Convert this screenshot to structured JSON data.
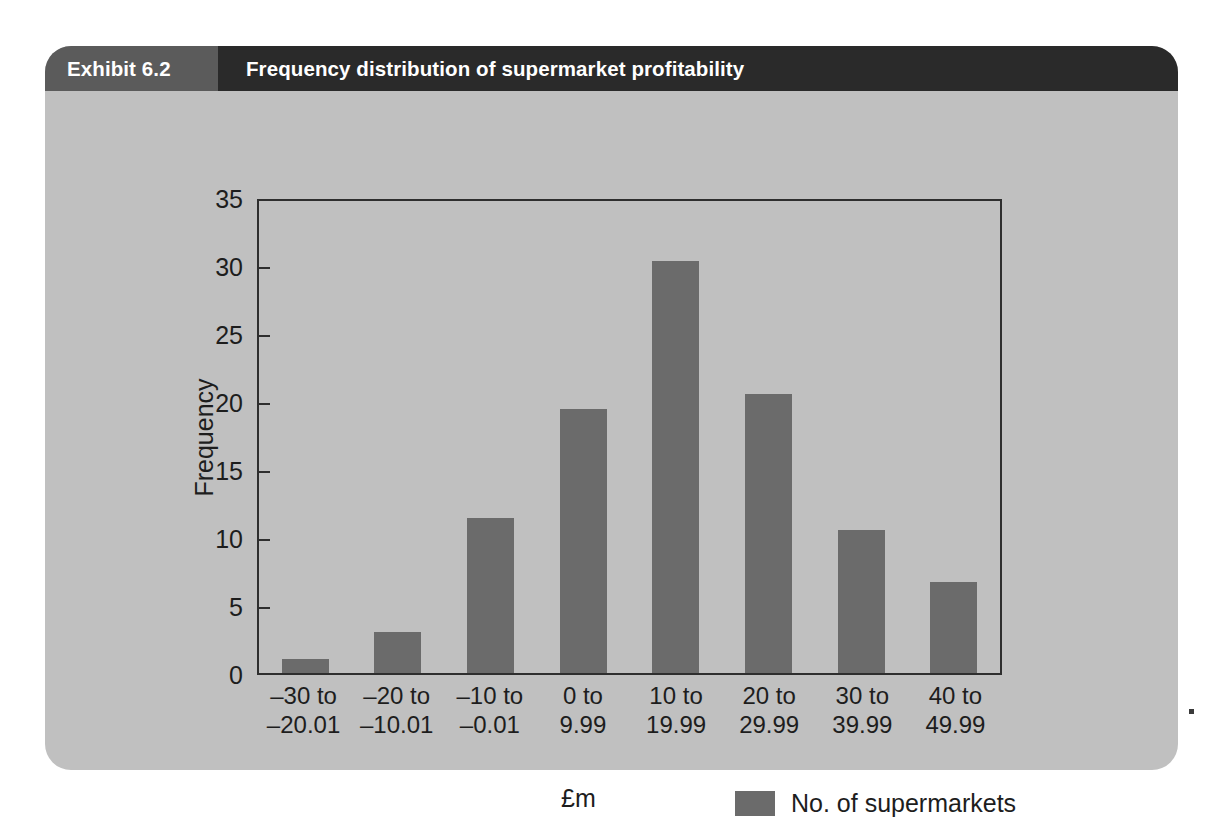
{
  "exhibit": {
    "number_label": "Exhibit 6.2",
    "title": "Frequency distribution of supermarket profitability"
  },
  "colors": {
    "card_background": "#c0c0c0",
    "header_number_band": "#5b5b5b",
    "header_title_band": "#2a2a2a",
    "bar_fill": "#6b6b6b",
    "axis_line": "#2e2e2e",
    "text": "#1d1d1d",
    "page_background": "#ffffff"
  },
  "chart_data": {
    "type": "bar",
    "title": "Frequency distribution of supermarket profitability",
    "subtitle": "",
    "xlabel": "£m",
    "ylabel": "Frequency",
    "categories": [
      "–30 to\n–20.01",
      "–20 to\n–10.01",
      "–10 to\n–0.01",
      "0 to\n9.99",
      "10 to\n19.99",
      "20 to\n29.99",
      "30 to\n39.99",
      "40 to\n49.99"
    ],
    "category_lines": [
      [
        "–30 to",
        "–20.01"
      ],
      [
        "–20 to",
        "–10.01"
      ],
      [
        "–10 to",
        "–0.01"
      ],
      [
        "0 to",
        "9.99"
      ],
      [
        "10 to",
        "19.99"
      ],
      [
        "20 to",
        "29.99"
      ],
      [
        "30 to",
        "39.99"
      ],
      [
        "40 to",
        "49.99"
      ]
    ],
    "values": [
      1,
      3,
      11.4,
      19.4,
      30.3,
      20.5,
      10.5,
      6.7
    ],
    "series": [
      {
        "name": "No. of supermarkets",
        "values": [
          1,
          3,
          11.4,
          19.4,
          30.3,
          20.5,
          10.5,
          6.7
        ]
      }
    ],
    "ylim": [
      0,
      35
    ],
    "yticks": [
      0,
      5,
      10,
      15,
      20,
      25,
      30,
      35
    ],
    "ytick_labels": [
      "0",
      "5",
      "10",
      "15",
      "20",
      "25",
      "30",
      "35"
    ],
    "grid": false,
    "legend_position": "bottom-right",
    "legend": [
      "No. of supermarkets"
    ]
  },
  "legend": {
    "label": "No. of supermarkets"
  }
}
